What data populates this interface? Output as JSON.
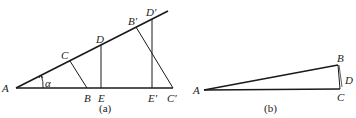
{
  "figure_a": {
    "caption": "(a)",
    "labels": {
      "A": "A",
      "B": "B",
      "C": "C",
      "D": "D",
      "E": "E",
      "B_prime": "B′",
      "D_prime": "D′",
      "E_prime": "E′",
      "C_prime": "C′",
      "alpha": "α"
    }
  },
  "figure_b": {
    "caption": "(b)",
    "labels": {
      "A": "A",
      "B": "B",
      "C": "C",
      "D": "D"
    }
  },
  "colors": {
    "stroke": "#1a1a1a",
    "background": "#ffffff"
  }
}
